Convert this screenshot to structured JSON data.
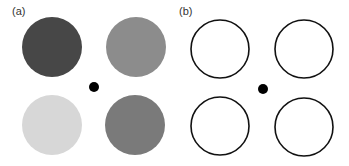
{
  "panels": [
    {
      "label": "(a)",
      "style": "filled",
      "circles": [
        {
          "position": "top-left",
          "cx": 52,
          "cy": 47,
          "r": 30,
          "fill": "#474747"
        },
        {
          "position": "top-right",
          "cx": 136,
          "cy": 47,
          "r": 30,
          "fill": "#8c8c8c"
        },
        {
          "position": "bottom-left",
          "cx": 52,
          "cy": 125,
          "r": 30,
          "fill": "#d7d7d7"
        },
        {
          "position": "bottom-right",
          "cx": 135,
          "cy": 125,
          "r": 30,
          "fill": "#7a7a7a"
        }
      ],
      "fixation_dot": {
        "cx": 94,
        "cy": 87,
        "r": 5,
        "fill": "#000000"
      }
    },
    {
      "label": "(b)",
      "style": "outline",
      "circles": [
        {
          "position": "top-left",
          "cx": 220,
          "cy": 49,
          "r": 29,
          "stroke": "#111111"
        },
        {
          "position": "top-right",
          "cx": 304,
          "cy": 49,
          "r": 29,
          "stroke": "#111111"
        },
        {
          "position": "bottom-left",
          "cx": 220,
          "cy": 126,
          "r": 29,
          "stroke": "#111111"
        },
        {
          "position": "bottom-right",
          "cx": 304,
          "cy": 127,
          "r": 29,
          "stroke": "#111111"
        }
      ],
      "fixation_dot": {
        "cx": 263,
        "cy": 89,
        "r": 5,
        "fill": "#000000"
      }
    }
  ]
}
